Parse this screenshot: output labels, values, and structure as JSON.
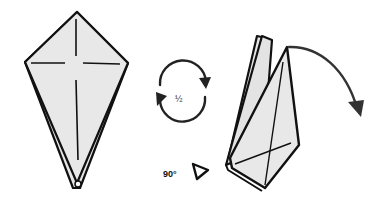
{
  "diagram": {
    "type": "origami-instruction",
    "steps": [
      {
        "id": "kite-base",
        "description": "Kite shape with crease lines (two layers)"
      },
      {
        "id": "turn-over",
        "symbol": "rotate-half-turn",
        "label": "½"
      },
      {
        "id": "rotate",
        "symbol": "triangle-pointer",
        "label": "90°"
      },
      {
        "id": "folded-model",
        "description": "Rotated folded model with flap to be folded down",
        "arrow": "curved-fold-arrow"
      }
    ],
    "labels": {
      "half": "½",
      "angle": "90°"
    },
    "colors": {
      "paper_fill": "#e6e6e6",
      "outline": "#111111",
      "arrow": "#333333",
      "background": "#ffffff"
    }
  }
}
